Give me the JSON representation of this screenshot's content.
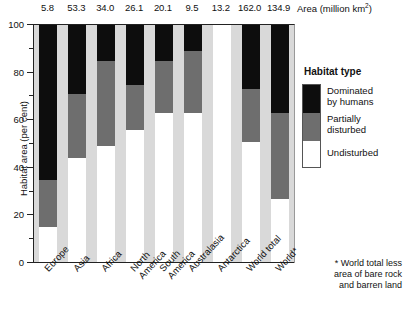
{
  "chart_data": {
    "type": "bar",
    "title": "",
    "subtitle": "",
    "stacked": true,
    "normalized_percent": true,
    "xlabel": "",
    "ylabel": "Habitat area (per cent)",
    "ylim": [
      0,
      100
    ],
    "yticks": [
      0,
      20,
      40,
      60,
      80,
      100
    ],
    "yticks_minor": [
      10,
      30,
      50,
      70,
      90
    ],
    "grid": false,
    "legend_position": "right",
    "legend_title": "Habitat type",
    "categories": [
      "Europe",
      "Asia",
      "Africa",
      "North America",
      "South America",
      "Australasia",
      "Antarctica",
      "World total",
      "World*"
    ],
    "series": [
      {
        "name": "Undisturbed",
        "color": "#ffffff",
        "values": [
          15,
          44,
          49,
          56,
          63,
          63,
          100,
          51,
          27
        ]
      },
      {
        "name": "Partially disturbed",
        "color": "#6e6e6e",
        "values": [
          20,
          27,
          36,
          19,
          22,
          26,
          0,
          22,
          36
        ]
      },
      {
        "name": "Dominated by humans",
        "color": "#0d0d0d",
        "values": [
          65,
          29,
          15,
          25,
          15,
          11,
          0,
          27,
          37
        ]
      }
    ],
    "secondary_axis": {
      "label": "Area (million km",
      "label_superscript": "2",
      "label_suffix": ")",
      "values": [
        "5.8",
        "53.3",
        "34.0",
        "26.1",
        "20.1",
        "9.5",
        "13.2",
        "162.0",
        "134.9"
      ]
    },
    "annotations": [
      "* World total less area of bare rock and barren land"
    ]
  },
  "axis": {
    "y_title": "Habitat area (per cent)",
    "y_tick_labels": [
      "100",
      "80",
      "60",
      "40",
      "20",
      "0"
    ]
  },
  "area_header": {
    "caption_prefix": "Area (million km",
    "caption_sup": "2",
    "caption_suffix": ")",
    "values": [
      "5.8",
      "53.3",
      "34.0",
      "26.1",
      "20.1",
      "9.5",
      "13.2",
      "162.0",
      "134.9"
    ]
  },
  "x_labels": [
    {
      "line1": "Europe",
      "line2": ""
    },
    {
      "line1": "Asia",
      "line2": ""
    },
    {
      "line1": "Africa",
      "line2": ""
    },
    {
      "line1": "North",
      "line2": "America"
    },
    {
      "line1": "South",
      "line2": "America"
    },
    {
      "line1": "Australasia",
      "line2": ""
    },
    {
      "line1": "Antarctica",
      "line2": ""
    },
    {
      "line1": "World total",
      "line2": ""
    },
    {
      "line1": "World*",
      "line2": ""
    }
  ],
  "legend": {
    "title": "Habitat type",
    "items": [
      {
        "label_line1": "Dominated",
        "label_line2": "by humans",
        "color": "#0d0d0d"
      },
      {
        "label_line1": "Partially",
        "label_line2": "disturbed",
        "color": "#6e6e6e"
      },
      {
        "label_line1": "Undisturbed",
        "label_line2": "",
        "color": "#ffffff"
      }
    ]
  },
  "footnote": {
    "line1": "* World total less",
    "line2": "area of bare rock",
    "line3": "and barren land"
  }
}
